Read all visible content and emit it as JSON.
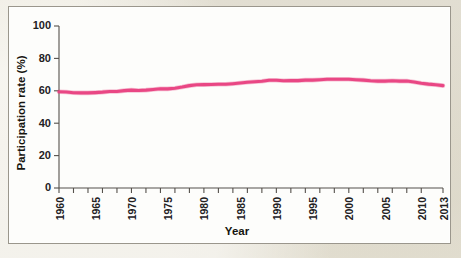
{
  "figure": {
    "panel_bg": "#fdfdfb",
    "page_bg": "#eae6da",
    "border_color": "#9a968c"
  },
  "chart_data": {
    "type": "line",
    "title": "",
    "xlabel": "Year",
    "ylabel": "Participation rate (%)",
    "xlim": [
      1960,
      2013
    ],
    "ylim": [
      0,
      100
    ],
    "grid": false,
    "legend": null,
    "line_color": "#e8407f",
    "y_ticks": [
      0,
      20,
      40,
      60,
      80,
      100
    ],
    "y_tick_labels": [
      "0",
      "20",
      "40",
      "60",
      "80",
      "100"
    ],
    "x_ticks": [
      1960,
      1962,
      1964,
      1966,
      1968,
      1970,
      1972,
      1974,
      1976,
      1978,
      1980,
      1982,
      1984,
      1986,
      1988,
      1990,
      1992,
      1994,
      1996,
      1998,
      2000,
      2002,
      2004,
      2006,
      2008,
      2010,
      2013
    ],
    "x_tick_labels": [
      "1960",
      "1965",
      "1970",
      "1975",
      "1980",
      "1985",
      "1990",
      "1995",
      "2000",
      "2005",
      "2010",
      "2013"
    ],
    "x_major_ticks": [
      1960,
      1965,
      1970,
      1975,
      1980,
      1985,
      1990,
      1995,
      2000,
      2005,
      2010,
      2013
    ],
    "series": [
      {
        "name": "Labor force participation rate",
        "x": [
          1960,
          1961,
          1962,
          1963,
          1964,
          1965,
          1966,
          1967,
          1968,
          1969,
          1970,
          1971,
          1972,
          1973,
          1974,
          1975,
          1976,
          1977,
          1978,
          1979,
          1980,
          1981,
          1982,
          1983,
          1984,
          1985,
          1986,
          1987,
          1988,
          1989,
          1990,
          1991,
          1992,
          1993,
          1994,
          1995,
          1996,
          1997,
          1998,
          1999,
          2000,
          2001,
          2002,
          2003,
          2004,
          2005,
          2006,
          2007,
          2008,
          2009,
          2010,
          2011,
          2012,
          2013
        ],
        "values": [
          59.4,
          59.3,
          58.8,
          58.7,
          58.7,
          58.9,
          59.2,
          59.6,
          59.6,
          60.1,
          60.4,
          60.2,
          60.4,
          60.8,
          61.3,
          61.2,
          61.6,
          62.3,
          63.2,
          63.7,
          63.8,
          63.9,
          64.0,
          64.0,
          64.4,
          64.8,
          65.3,
          65.6,
          65.9,
          66.5,
          66.5,
          66.2,
          66.4,
          66.3,
          66.6,
          66.6,
          66.8,
          67.1,
          67.1,
          67.1,
          67.1,
          66.8,
          66.6,
          66.2,
          66.0,
          66.0,
          66.2,
          66.0,
          66.0,
          65.4,
          64.7,
          64.1,
          63.7,
          63.2
        ],
        "color": "#e8407f"
      }
    ]
  }
}
